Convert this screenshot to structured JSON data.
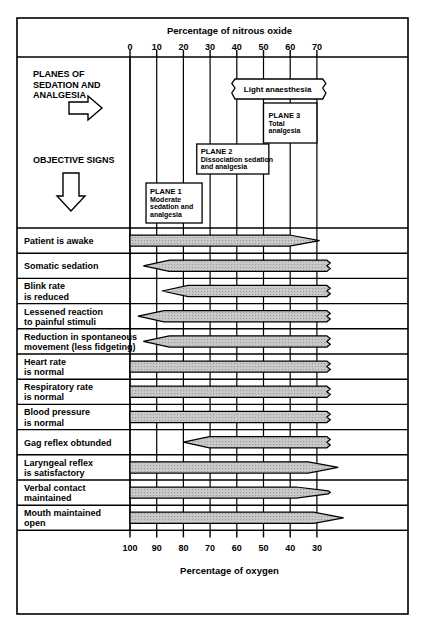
{
  "chart_data": {
    "type": "bar",
    "title": "Percentage of nitrous oxide",
    "xlabel_top": "Percentage of nitrous oxide",
    "xlabel_bottom": "Percentage of oxygen",
    "grid": true,
    "legend_position": "none",
    "axis_top": {
      "label": "Percentage of nitrous oxide",
      "ticks": [
        "0",
        "10",
        "20",
        "30",
        "40",
        "50",
        "60",
        "70"
      ],
      "values": [
        0,
        10,
        20,
        30,
        40,
        50,
        60,
        70
      ],
      "range": [
        0,
        70
      ]
    },
    "axis_bottom": {
      "label": "Percentage of oxygen",
      "ticks": [
        "100",
        "90",
        "80",
        "70",
        "60",
        "50",
        "40",
        "30"
      ],
      "values": [
        100,
        90,
        80,
        70,
        60,
        50,
        40,
        30
      ],
      "range": [
        100,
        30
      ]
    },
    "side_headers": [
      {
        "label": "PLANES OF\nSEDATION AND\nANALGESIA",
        "line1": "PLANES OF",
        "line2": "SEDATION AND",
        "line3": "ANALGESIA",
        "arrow": "right-arrow-icon"
      },
      {
        "label": "OBJECTIVE SIGNS",
        "line1": "OBJECTIVE SIGNS",
        "arrow": "down-arrow-icon"
      }
    ],
    "planes": [
      {
        "name": "light-anaesthesia",
        "lines": [
          "Light anaesthesia"
        ],
        "start_n2o": 40,
        "end_n2o": 70,
        "torn_left": true,
        "torn_right": true
      },
      {
        "name": "plane-3",
        "lines": [
          "PLANE 3",
          "Total",
          "analgesia"
        ],
        "start_n2o": 50,
        "end_n2o": 70,
        "torn_left": false,
        "torn_right": false
      },
      {
        "name": "plane-2",
        "lines": [
          "PLANE 2",
          "Dissociation sedation",
          "and analgesia"
        ],
        "start_n2o": 25,
        "end_n2o": 52,
        "torn_left": false,
        "torn_right": false
      },
      {
        "name": "plane-1",
        "lines": [
          "PLANE 1",
          "Moderate",
          "sedation and",
          "analgesia"
        ],
        "start_n2o": 6,
        "end_n2o": 27,
        "torn_left": false,
        "torn_right": false
      }
    ],
    "categories": [
      "Patient is awake",
      "Somatic sedation",
      "Blink rate is reduced",
      "Lessened reaction to painful stimuli",
      "Reduction in spontaneous movement (less fidgeting)",
      "Heart rate is normal",
      "Respiratory rate is normal",
      "Blood pressure is normal",
      "Gag reflex obtunded",
      "Laryngeal reflex is satisfactory",
      "Verbal contact maintained",
      "Mouth maintained open"
    ],
    "rows": [
      {
        "label_lines": [
          "Patient is awake"
        ],
        "start_n2o": 0,
        "end_n2o": 71,
        "left_shape": "flat",
        "right_shape": "point"
      },
      {
        "label_lines": [
          "Somatic sedation"
        ],
        "start_n2o": 5,
        "end_n2o": 75,
        "left_shape": "point",
        "right_shape": "torn"
      },
      {
        "label_lines": [
          "Blink rate",
          "is reduced"
        ],
        "start_n2o": 12,
        "end_n2o": 75,
        "left_shape": "point",
        "right_shape": "torn"
      },
      {
        "label_lines": [
          "Lessened reaction",
          "to painful stimuli"
        ],
        "start_n2o": 3,
        "end_n2o": 75,
        "left_shape": "point",
        "right_shape": "torn"
      },
      {
        "label_lines": [
          "Reduction in spontaneous",
          "movement (less fidgeting)"
        ],
        "start_n2o": 5,
        "end_n2o": 75,
        "left_shape": "point",
        "right_shape": "torn"
      },
      {
        "label_lines": [
          "Heart rate",
          "is normal"
        ],
        "start_n2o": 0,
        "end_n2o": 75,
        "left_shape": "flat",
        "right_shape": "torn"
      },
      {
        "label_lines": [
          "Respiratory rate",
          "is normal"
        ],
        "start_n2o": 0,
        "end_n2o": 75,
        "left_shape": "flat",
        "right_shape": "torn"
      },
      {
        "label_lines": [
          "Blood pressure",
          "is normal"
        ],
        "start_n2o": 0,
        "end_n2o": 75,
        "left_shape": "flat",
        "right_shape": "torn"
      },
      {
        "label_lines": [
          "Gag reflex obtunded"
        ],
        "start_n2o": 20,
        "end_n2o": 75,
        "left_shape": "point",
        "right_shape": "torn"
      },
      {
        "label_lines": [
          "Laryngeal reflex",
          "is satisfactory"
        ],
        "start_n2o": 0,
        "end_n2o": 78,
        "left_shape": "flat",
        "right_shape": "point"
      },
      {
        "label_lines": [
          "Verbal contact",
          "maintained"
        ],
        "start_n2o": 0,
        "end_n2o": 75,
        "left_shape": "flat",
        "right_shape": "point-torn"
      },
      {
        "label_lines": [
          "Mouth maintained",
          "open"
        ],
        "start_n2o": 0,
        "end_n2o": 80,
        "left_shape": "flat",
        "right_shape": "point"
      }
    ],
    "colors": {
      "bar_fill": "#c9c9c9",
      "bar_stroke": "#000000",
      "frame": "#000000",
      "grid": "#000000",
      "background": "#ffffff"
    }
  }
}
